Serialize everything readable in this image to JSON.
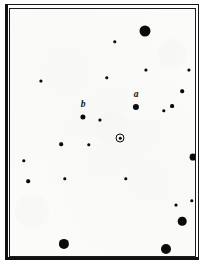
{
  "chart_data": {
    "type": "scatter",
    "title": "",
    "subtitle": "",
    "xlabel": "",
    "ylabel": "",
    "xlim": [
      0,
      185
    ],
    "ylim": [
      0,
      247
    ],
    "grid": false,
    "legend": null,
    "axis_inverted_y": true,
    "series": [
      {
        "name": "field-stars",
        "points": [
          {
            "id": "s01",
            "x": 135,
            "y": 22,
            "size": 11.0,
            "mag_class": "bright",
            "label": ""
          },
          {
            "id": "s02",
            "x": 105,
            "y": 33,
            "size": 3.4,
            "mag_class": "faint",
            "label": ""
          },
          {
            "id": "s03",
            "x": 179,
            "y": 61,
            "size": 3.2,
            "mag_class": "faint",
            "label": ""
          },
          {
            "id": "s04",
            "x": 136,
            "y": 61,
            "size": 3.2,
            "mag_class": "faint",
            "label": ""
          },
          {
            "id": "s05",
            "x": 97,
            "y": 69,
            "size": 3.4,
            "mag_class": "faint",
            "label": ""
          },
          {
            "id": "s06",
            "x": 31,
            "y": 72,
            "size": 3.2,
            "mag_class": "faint",
            "label": ""
          },
          {
            "id": "s07",
            "x": 172,
            "y": 82,
            "size": 3.6,
            "mag_class": "faint",
            "label": ""
          },
          {
            "id": "s08",
            "x": 126,
            "y": 98,
            "size": 6.2,
            "mag_class": "medium",
            "label": "a"
          },
          {
            "id": "s09",
            "x": 162,
            "y": 97,
            "size": 3.8,
            "mag_class": "faint",
            "label": ""
          },
          {
            "id": "s10",
            "x": 154,
            "y": 102,
            "size": 3.4,
            "mag_class": "faint",
            "label": ""
          },
          {
            "id": "s11",
            "x": 73,
            "y": 108,
            "size": 5.2,
            "mag_class": "medium",
            "label": "b"
          },
          {
            "id": "s12",
            "x": 90,
            "y": 111,
            "size": 3.2,
            "mag_class": "faint",
            "label": ""
          },
          {
            "id": "s13",
            "x": 51,
            "y": 135,
            "size": 3.6,
            "mag_class": "faint",
            "label": ""
          },
          {
            "id": "s14",
            "x": 79,
            "y": 136,
            "size": 3.4,
            "mag_class": "faint",
            "label": ""
          },
          {
            "id": "s15",
            "x": 183,
            "y": 148,
            "size": 6.8,
            "mag_class": "medium",
            "label": "k"
          },
          {
            "id": "s16",
            "x": 14,
            "y": 152,
            "size": 3.4,
            "mag_class": "faint",
            "label": ""
          },
          {
            "id": "s17",
            "x": 18,
            "y": 172,
            "size": 3.6,
            "mag_class": "faint",
            "label": ""
          },
          {
            "id": "s18",
            "x": 55,
            "y": 170,
            "size": 3.4,
            "mag_class": "faint",
            "label": ""
          },
          {
            "id": "s19",
            "x": 116,
            "y": 170,
            "size": 3.4,
            "mag_class": "faint",
            "label": ""
          },
          {
            "id": "s20",
            "x": 166,
            "y": 196,
            "size": 3.0,
            "mag_class": "faint",
            "label": ""
          },
          {
            "id": "s21",
            "x": 182,
            "y": 192,
            "size": 3.4,
            "mag_class": "faint",
            "label": ""
          },
          {
            "id": "s22",
            "x": 172,
            "y": 212,
            "size": 8.6,
            "mag_class": "bright",
            "label": ""
          },
          {
            "id": "s23",
            "x": 54,
            "y": 235,
            "size": 10.2,
            "mag_class": "bright",
            "label": ""
          },
          {
            "id": "s24",
            "x": 156,
            "y": 240,
            "size": 10.0,
            "mag_class": "bright",
            "label": ""
          }
        ]
      }
    ],
    "target": {
      "id": "target-star",
      "x": 110,
      "y": 129,
      "core_size": 3.4,
      "ring_size": 9.0,
      "marker": "circled-dot",
      "label": ""
    },
    "labels": [
      {
        "id": "label-a",
        "text": "a",
        "x": 126,
        "y": 86,
        "font_size": 9.5,
        "anchor_star": "s08"
      },
      {
        "id": "label-b",
        "text": "b",
        "x": 73,
        "y": 96,
        "font_size": 9.5,
        "anchor_star": "s11"
      },
      {
        "id": "label-k",
        "text": "k",
        "x": 194,
        "y": 148,
        "font_size": 9.5,
        "anchor_star": "s15"
      }
    ]
  },
  "chart": {
    "caption": "",
    "colors": {
      "ink": "#0a0a0a",
      "paper": "#fbfbf9",
      "frame": "#161616",
      "page_background": "#ffffff"
    }
  }
}
